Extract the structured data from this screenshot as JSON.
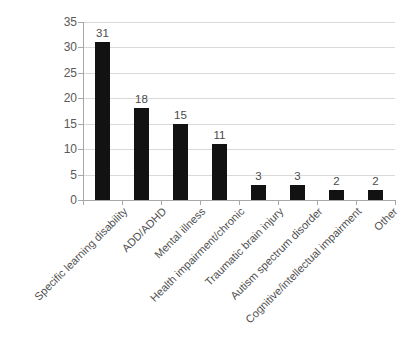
{
  "chart_data": {
    "type": "bar",
    "title": "",
    "subtitle": "",
    "xlabel": "",
    "ylabel": "",
    "orientation": "vertical",
    "grid": true,
    "gridlines": "horizontal",
    "legend": false,
    "legend_position": "none",
    "bar_color": "#121212",
    "gridline_color": "#d9d9d9",
    "axis_color": "#a8a8a8",
    "text_color": "#4f4f4f",
    "background_color": "#ffffff",
    "ylim": [
      0,
      35
    ],
    "ytick_interval": 5,
    "ytick_labels": [
      "0",
      "5",
      "10",
      "15",
      "20",
      "25",
      "30",
      "35"
    ],
    "ytick_values": [
      0,
      5,
      10,
      15,
      20,
      25,
      30,
      35
    ],
    "categories": [
      "Specific learning disability",
      "ADD/ADHD",
      "Mental illness",
      "Health impairment/chronic",
      "Traumatic brain injury",
      "Autism spectrum disorder",
      "Cognitive/intellectual impairment",
      "Other"
    ],
    "values": [
      31,
      18,
      15,
      11,
      3,
      3,
      2,
      2
    ],
    "data_labels": [
      "31",
      "18",
      "15",
      "11",
      "3",
      "3",
      "2",
      "2"
    ],
    "label_rotation_degrees": -45
  }
}
